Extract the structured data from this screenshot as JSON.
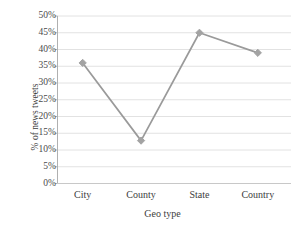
{
  "chart_data": {
    "type": "line",
    "title": "",
    "xlabel": "Geo type",
    "ylabel": "% of news tweets",
    "categories": [
      "City",
      "County",
      "State",
      "Country"
    ],
    "values": [
      36,
      12.8,
      45,
      39
    ],
    "ytick_labels": [
      "0%",
      "5%",
      "10%",
      "15%",
      "20%",
      "25%",
      "30%",
      "35%",
      "40%",
      "45%",
      "50%"
    ],
    "ytick_values": [
      0,
      5,
      10,
      15,
      20,
      25,
      30,
      35,
      40,
      45,
      50
    ],
    "ylim": [
      0,
      50
    ],
    "grid": true,
    "grid_axis": "y",
    "legend": false,
    "legend_position": "none",
    "series_color": "#9a9a9a",
    "marker": "diamond",
    "marker_color": "#a3a3a3",
    "grid_color": "#e2e2e2",
    "axis_color": "#b0b0b0",
    "text_color": "#3d3d3d"
  }
}
